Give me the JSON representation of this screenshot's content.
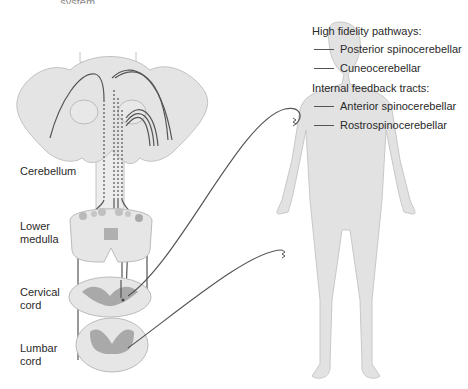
{
  "figure": {
    "top_cropped_text": "... system",
    "labels": {
      "cerebellum": "Cerebellum",
      "lower_medulla_1": "Lower",
      "lower_medulla_2": "medulla",
      "cervical_1": "Cervical",
      "cervical_2": "cord",
      "lumbar_1": "Lumbar",
      "lumbar_2": "cord"
    },
    "legend": {
      "group1_title": "High fidelity pathways:",
      "group1_items": [
        "Posterior spinocerebellar",
        "Cuneocerebellar"
      ],
      "group2_title": "Internal feedback tracts:",
      "group2_items": [
        "Anterior spinocerebellar",
        "Rostrospinocerebellar"
      ]
    },
    "colors": {
      "tissue_fill": "#e2e2e2",
      "grey_matter": "#a9a9a9",
      "pathway_line": "#555555",
      "outline": "#b8b8b8"
    }
  }
}
